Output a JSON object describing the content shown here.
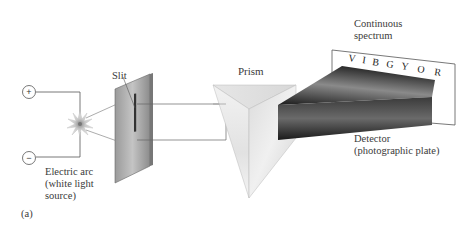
{
  "figure": {
    "panel_label": "(a)"
  },
  "source": {
    "positive_terminal": "+",
    "negative_terminal": "−",
    "label_line1": "Electric arc",
    "label_line2": "(white light",
    "label_line3": "source)"
  },
  "slit": {
    "label": "Slit"
  },
  "prism": {
    "label": "Prism"
  },
  "spectrum": {
    "label_line1": "Continuous",
    "label_line2": "spectrum",
    "letters": [
      "V",
      "I",
      "B",
      "G",
      "Y",
      "O",
      "R"
    ]
  },
  "detector": {
    "label_line1": "Detector",
    "label_line2": "(photographic plate)"
  },
  "colors": {
    "line": "#555555",
    "slit_plate": "#8a8a8a",
    "prism_light": "#ececec",
    "beam_dark": "#1e1e1e"
  }
}
